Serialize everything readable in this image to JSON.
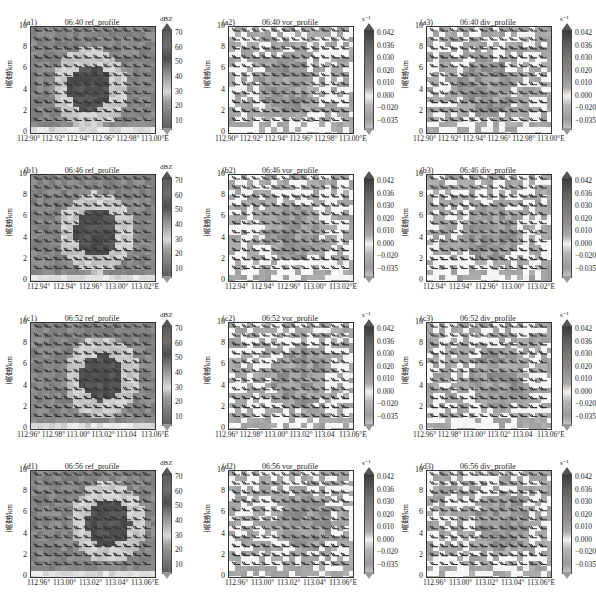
{
  "figure": {
    "ylabel": "高度/km",
    "yticks": [
      "10",
      "8",
      "6",
      "4",
      "2",
      "0"
    ],
    "ref_colorbar": {
      "unit": "dBZ",
      "ticks": [
        "70",
        "60",
        "50",
        "40",
        "30",
        "20",
        "10"
      ]
    },
    "vd_colorbar": {
      "unit": "s⁻¹",
      "ticks": [
        "0.042",
        "0.036",
        "0.030",
        "0.020",
        "0.010",
        "0.000",
        "−0.020",
        "−0.035"
      ]
    },
    "rows": [
      {
        "panels": [
          {
            "tag": "(a1)",
            "title": "06:40 ref_profile",
            "kind": "ref",
            "xticks": [
              "112.90°",
              "112.92°",
              "112.94°",
              "112.96°",
              "112.98°",
              "113.00°E"
            ]
          },
          {
            "tag": "(a2)",
            "title": "06:40 vor_profile",
            "kind": "vd",
            "xticks": [
              "112.90°",
              "112.92°",
              "112.94°",
              "112.96°",
              "112.98°",
              "113.00°E"
            ]
          },
          {
            "tag": "(a3)",
            "title": "06:40 div_profile",
            "kind": "vd",
            "xticks": [
              "112.90°",
              "112.92°",
              "112.94°",
              "112.96°",
              "112.98°",
              "113.00°E"
            ]
          }
        ]
      },
      {
        "panels": [
          {
            "tag": "(b1)",
            "title": "06:46 ref_profile",
            "kind": "ref",
            "xticks": [
              "112.94°",
              "112.94°",
              "112.96°",
              "113.00°",
              "113.02°E"
            ]
          },
          {
            "tag": "(b2)",
            "title": "06:46 vor_profile",
            "kind": "vd",
            "xticks": [
              "112.94°",
              "112.94°",
              "112.96°",
              "113.00°",
              "113.02°E"
            ]
          },
          {
            "tag": "(b3)",
            "title": "06:46 div_profile",
            "kind": "vd",
            "xticks": [
              "112.94°",
              "112.94°",
              "112.96°",
              "113.00°",
              "113.02°E"
            ]
          }
        ]
      },
      {
        "panels": [
          {
            "tag": "(c1)",
            "title": "06:52 ref_profile",
            "kind": "ref",
            "xticks": [
              "112.96°",
              "112.98°",
              "113.00°",
              "113.02°",
              "113.04",
              "113.06°E"
            ]
          },
          {
            "tag": "(c2)",
            "title": "06:52 vor_profile",
            "kind": "vd",
            "xticks": [
              "112.96°",
              "112.98°",
              "113.00°",
              "113.02°",
              "113.04",
              "113.06°E"
            ]
          },
          {
            "tag": "(c3)",
            "title": "06:52 div_profile",
            "kind": "vd",
            "xticks": [
              "112.96°",
              "112.98°",
              "113.00°",
              "113.02°",
              "113.04",
              "113.06°E"
            ]
          }
        ]
      },
      {
        "panels": [
          {
            "tag": "(d1)",
            "title": "06:56 ref_profile",
            "kind": "ref",
            "xticks": [
              "112.96°",
              "113.00°",
              "113.02°",
              "113.04°",
              "113.06°E"
            ]
          },
          {
            "tag": "(d2)",
            "title": "06:56 vor_profile",
            "kind": "vd",
            "xticks": [
              "112.96°",
              "113.00°",
              "113.02°",
              "113.04°",
              "113.06°E"
            ]
          },
          {
            "tag": "(d3)",
            "title": "06:56 div_profile",
            "kind": "vd",
            "xticks": [
              "112.96°",
              "113.00°",
              "113.02°",
              "113.04°",
              "113.06°E"
            ]
          }
        ]
      }
    ]
  },
  "chart_data": [
    {
      "type": "heatmap",
      "title": "(a1) 06:40 ref_profile",
      "ylabel": "高度/km",
      "ylim": [
        0,
        10
      ],
      "xlabel": "",
      "x_ticks": [
        "112.90°",
        "112.92°",
        "112.94°",
        "112.96°",
        "112.98°",
        "113.00°E"
      ],
      "colorbar": {
        "label": "dBZ",
        "ticks": [
          10,
          20,
          30,
          40,
          50,
          60,
          70
        ]
      },
      "overlay": "wind barbs"
    },
    {
      "type": "heatmap",
      "title": "(a2) 06:40 vor_profile",
      "ylabel": "高度/km",
      "ylim": [
        0,
        10
      ],
      "x_ticks": [
        "112.90°",
        "112.92°",
        "112.94°",
        "112.96°",
        "112.98°",
        "113.00°E"
      ],
      "colorbar": {
        "label": "s^-1",
        "ticks": [
          -0.035,
          -0.02,
          0.0,
          0.01,
          0.02,
          0.03,
          0.036,
          0.042
        ]
      },
      "overlay": "wind barbs"
    },
    {
      "type": "heatmap",
      "title": "(a3) 06:40 div_profile",
      "ylabel": "高度/km",
      "ylim": [
        0,
        10
      ],
      "x_ticks": [
        "112.90°",
        "112.92°",
        "112.94°",
        "112.96°",
        "112.98°",
        "113.00°E"
      ],
      "colorbar": {
        "label": "s^-1",
        "ticks": [
          -0.035,
          -0.02,
          0.0,
          0.01,
          0.02,
          0.03,
          0.036,
          0.042
        ]
      },
      "overlay": "wind barbs"
    },
    {
      "type": "heatmap",
      "title": "(b1) 06:46 ref_profile",
      "ylabel": "高度/km",
      "ylim": [
        0,
        10
      ],
      "x_ticks": [
        "112.94°",
        "112.94°",
        "112.96°",
        "113.00°",
        "113.02°E"
      ],
      "colorbar": {
        "label": "dBZ",
        "ticks": [
          10,
          20,
          30,
          40,
          50,
          60,
          70
        ]
      },
      "overlay": "wind barbs"
    },
    {
      "type": "heatmap",
      "title": "(b2) 06:46 vor_profile",
      "ylabel": "高度/km",
      "ylim": [
        0,
        10
      ],
      "x_ticks": [
        "112.94°",
        "112.94°",
        "112.96°",
        "113.00°",
        "113.02°E"
      ],
      "colorbar": {
        "label": "s^-1",
        "ticks": [
          -0.035,
          -0.02,
          0.0,
          0.01,
          0.02,
          0.03,
          0.036,
          0.042
        ]
      },
      "overlay": "wind barbs"
    },
    {
      "type": "heatmap",
      "title": "(b3) 06:46 div_profile",
      "ylabel": "高度/km",
      "ylim": [
        0,
        10
      ],
      "x_ticks": [
        "112.94°",
        "112.94°",
        "112.96°",
        "113.00°",
        "113.02°E"
      ],
      "colorbar": {
        "label": "s^-1",
        "ticks": [
          -0.035,
          -0.02,
          0.0,
          0.01,
          0.02,
          0.03,
          0.036,
          0.042
        ]
      },
      "overlay": "wind barbs"
    },
    {
      "type": "heatmap",
      "title": "(c1) 06:52 ref_profile",
      "ylabel": "高度/km",
      "ylim": [
        0,
        10
      ],
      "x_ticks": [
        "112.96°",
        "112.98°",
        "113.00°",
        "113.02°",
        "113.04",
        "113.06°E"
      ],
      "colorbar": {
        "label": "dBZ",
        "ticks": [
          10,
          20,
          30,
          40,
          50,
          60,
          70
        ]
      },
      "overlay": "wind barbs"
    },
    {
      "type": "heatmap",
      "title": "(c2) 06:52 vor_profile",
      "ylabel": "高度/km",
      "ylim": [
        0,
        10
      ],
      "x_ticks": [
        "112.96°",
        "112.98°",
        "113.00°",
        "113.02°",
        "113.04",
        "113.06°E"
      ],
      "colorbar": {
        "label": "s^-1",
        "ticks": [
          -0.035,
          -0.02,
          0.0,
          0.01,
          0.02,
          0.03,
          0.036,
          0.042
        ]
      },
      "overlay": "wind barbs"
    },
    {
      "type": "heatmap",
      "title": "(c3) 06:52 div_profile",
      "ylabel": "高度/km",
      "ylim": [
        0,
        10
      ],
      "x_ticks": [
        "112.96°",
        "112.98°",
        "113.00°",
        "113.02°",
        "113.04",
        "113.06°E"
      ],
      "colorbar": {
        "label": "s^-1",
        "ticks": [
          -0.035,
          -0.02,
          0.0,
          0.01,
          0.02,
          0.03,
          0.036,
          0.042
        ]
      },
      "overlay": "wind barbs"
    },
    {
      "type": "heatmap",
      "title": "(d1) 06:56 ref_profile",
      "ylabel": "高度/km",
      "ylim": [
        0,
        10
      ],
      "x_ticks": [
        "112.96°",
        "113.00°",
        "113.02°",
        "113.04°",
        "113.06°E"
      ],
      "colorbar": {
        "label": "dBZ",
        "ticks": [
          10,
          20,
          30,
          40,
          50,
          60,
          70
        ]
      },
      "overlay": "wind barbs"
    },
    {
      "type": "heatmap",
      "title": "(d2) 06:56 vor_profile",
      "ylabel": "高度/km",
      "ylim": [
        0,
        10
      ],
      "x_ticks": [
        "112.96°",
        "113.00°",
        "113.02°",
        "113.04°",
        "113.06°E"
      ],
      "colorbar": {
        "label": "s^-1",
        "ticks": [
          -0.035,
          -0.02,
          0.0,
          0.01,
          0.02,
          0.03,
          0.036,
          0.042
        ]
      },
      "overlay": "wind barbs"
    },
    {
      "type": "heatmap",
      "title": "(d3) 06:56 div_profile",
      "ylabel": "高度/km",
      "ylim": [
        0,
        10
      ],
      "x_ticks": [
        "112.96°",
        "113.00°",
        "113.02°",
        "113.04°",
        "113.06°E"
      ],
      "colorbar": {
        "label": "s^-1",
        "ticks": [
          -0.035,
          -0.02,
          0.0,
          0.01,
          0.02,
          0.03,
          0.036,
          0.042
        ]
      },
      "overlay": "wind barbs"
    }
  ]
}
